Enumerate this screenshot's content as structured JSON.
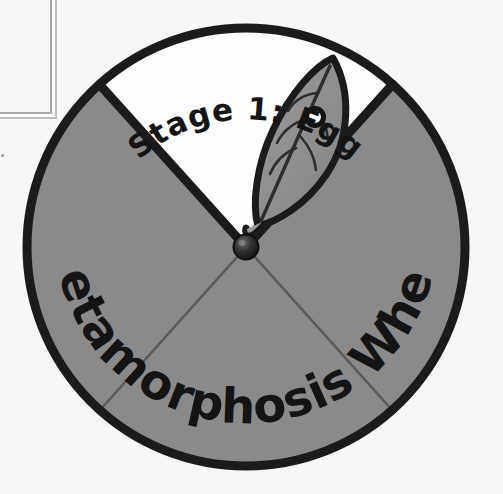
{
  "scene": {
    "title": "Metamorphosis Wheel",
    "background_color": "#f7f7f7",
    "description": "Hand-drawn paper metamorphosis wheel split into four sectors with one open white sector"
  },
  "wheel": {
    "name": "metamorphosis-wheel",
    "title_text": "Metamorphosis Wheel",
    "center_x": 246,
    "center_y": 247,
    "radius": 219,
    "outline_color": "#1b1b1b",
    "outline_width": 9,
    "filled_sector_color": "#8a8a8a",
    "open_sector_color": "#fdfdfd",
    "spoke_color": "#5d5d5d",
    "hub_color": "#2b2b2b",
    "hub_radius": 12,
    "sectors": [
      {
        "name": "window-sector",
        "label": "Stage 1: Egg",
        "start_angle": -132,
        "end_angle": -48,
        "fill": "#fdfdfd",
        "open": true
      },
      {
        "name": "left-sector",
        "label": "",
        "start_angle": 132,
        "end_angle": 228,
        "fill": "#8a8a8a",
        "open": false
      },
      {
        "name": "bottom-sector",
        "label": "",
        "start_angle": 48,
        "end_angle": 132,
        "fill": "#8a8a8a",
        "open": false
      },
      {
        "name": "right-sector",
        "label": "",
        "start_angle": -48,
        "end_angle": 48,
        "fill": "#8a8a8a",
        "open": false
      }
    ]
  },
  "labels": {
    "stage_label": "Stage 1: Egg",
    "wheel_title": "Metamorphosis Wheel",
    "stage_label_color": "#141414",
    "wheel_title_color": "#141414"
  },
  "illustration": {
    "name": "leaf-with-egg",
    "leaf_fill": "#8d8d8d",
    "leaf_outline": "#1b1b1b",
    "vein_color": "#2d2d2d",
    "egg_fill": "#ffffff",
    "egg_outline": "#141414",
    "egg_radius": 8,
    "caption": "leaf with butterfly egg"
  }
}
